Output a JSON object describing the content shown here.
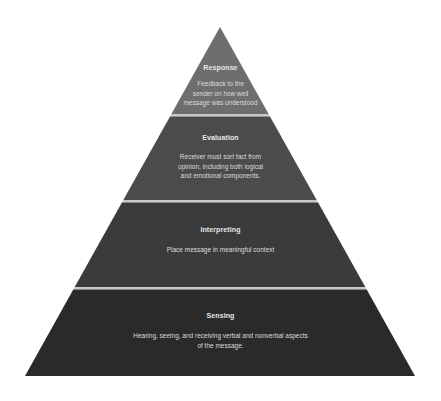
{
  "diagram": {
    "type": "pyramid",
    "levels": [
      {
        "title": "Response",
        "description_lines": [
          "Feedback to the",
          "sender on how well",
          "message was understood"
        ],
        "color": "#6e6e6e"
      },
      {
        "title": "Evaluation",
        "description_lines": [
          "Receiver must sort fact from",
          "opinion, including both logical",
          "and emotional components."
        ],
        "color": "#4b4b4b"
      },
      {
        "title": "Interpreting",
        "description_lines": [
          "Place message in meaningful context"
        ],
        "color": "#3b3b3b"
      },
      {
        "title": "Sensing",
        "description_lines": [
          "Hearing, seeing, and receiving verbal and nonverbal aspects",
          "of the message."
        ],
        "color": "#2a2a2a"
      }
    ],
    "divider_color": "#c8c8c8"
  }
}
